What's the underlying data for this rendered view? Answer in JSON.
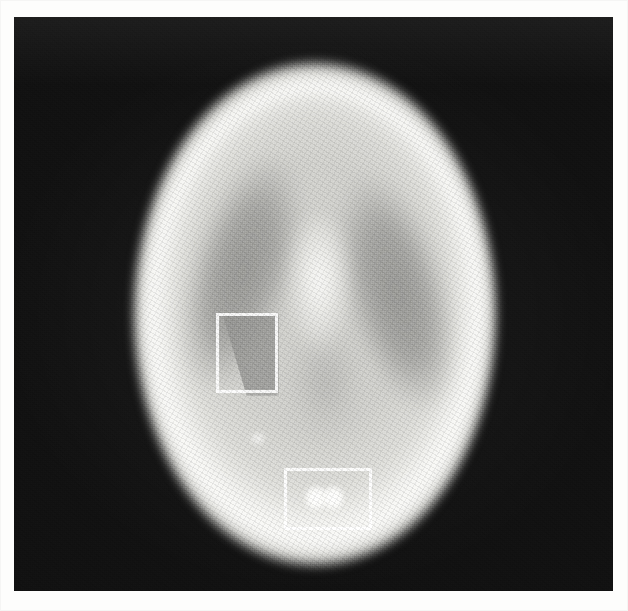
{
  "figure": {
    "kind": "grayscale-medical-phantom-scan",
    "caption": "",
    "width_px": 628,
    "height_px": 611
  },
  "canvas": {
    "background_color": "#121212",
    "paper_color": "#fdfdfc",
    "left_px": 14,
    "top_px": 17,
    "width_px": 599,
    "height_px": 574,
    "texture": "halftone-print-grain"
  },
  "phantom": {
    "name": "elliptical head phantom",
    "outer_shell": {
      "label": "skull",
      "center_x_px": 301,
      "center_y_px": 297,
      "radius_x_px": 185,
      "radius_y_px": 256,
      "rim_color": "#fbfbf9",
      "body_color": "#d8d8d4"
    },
    "inner_region": {
      "label": "brain matter",
      "center_x_px": 301,
      "center_y_px": 298,
      "radius_x_px": 155,
      "radius_y_px": 220,
      "color": "#d3d3cf"
    },
    "lesions": [
      {
        "label": "ventricle-left",
        "kind": "cold-ellipse",
        "center_x_px": 228,
        "center_y_px": 255,
        "radius_x_px": 52,
        "radius_y_px": 125,
        "rotation_deg": 17,
        "color": "#9a9a97"
      },
      {
        "label": "ventricle-right",
        "kind": "cold-ellipse",
        "center_x_px": 382,
        "center_y_px": 275,
        "radius_x_px": 52,
        "radius_y_px": 125,
        "rotation_deg": -16,
        "color": "#9a9a97"
      },
      {
        "label": "midline-shadow",
        "kind": "cold-ellipse",
        "center_x_px": 311,
        "center_y_px": 365,
        "radius_x_px": 43,
        "radius_y_px": 65,
        "rotation_deg": 0,
        "color": "#b2b2af"
      },
      {
        "label": "septum",
        "kind": "hot-wedge",
        "center_x_px": 305,
        "center_y_px": 271,
        "radius_x_px": 33,
        "radius_y_px": 75,
        "rotation_deg": 0,
        "color": "#fffffd"
      },
      {
        "label": "cold-wedge",
        "kind": "cold-triangle",
        "center_x_px": 234,
        "center_y_px": 337,
        "width_px": 62,
        "height_px": 84,
        "color": "#969693"
      },
      {
        "label": "hot-spot-1",
        "kind": "hot-point",
        "center_x_px": 302,
        "center_y_px": 481,
        "radius_px": 11,
        "color": "#ffffff"
      },
      {
        "label": "hot-spot-2",
        "kind": "hot-point",
        "center_x_px": 319,
        "center_y_px": 481,
        "radius_px": 11,
        "color": "#ffffff"
      },
      {
        "label": "hot-spot-stray",
        "kind": "hot-point",
        "center_x_px": 244,
        "center_y_px": 421,
        "radius_px": 8,
        "color": "#fcfcfa"
      }
    ]
  },
  "roi_boxes": [
    {
      "label": "roi-1",
      "x_px": 202,
      "y_px": 296,
      "width_px": 62,
      "height_px": 80,
      "stroke_color": "#ffffff",
      "stroke_width_px": 3,
      "annotation": "",
      "contains": "cold-wedge"
    },
    {
      "label": "roi-2",
      "x_px": 270,
      "y_px": 451,
      "width_px": 88,
      "height_px": 62,
      "stroke_color": "#ffffff",
      "stroke_width_px": 3,
      "annotation": "",
      "contains": "hot-spot-pair"
    }
  ]
}
